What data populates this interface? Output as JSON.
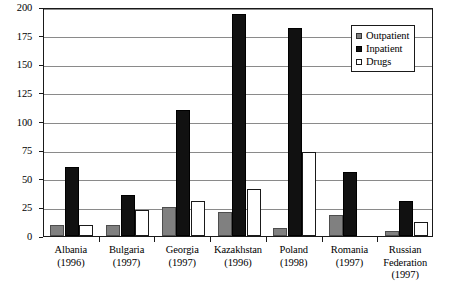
{
  "chart_data": {
    "type": "bar",
    "title": "",
    "subtitle": "",
    "xlabel": "",
    "ylabel": "",
    "ylim": [
      0,
      200
    ],
    "yticks": [
      0,
      25,
      50,
      75,
      100,
      125,
      150,
      175,
      200
    ],
    "ytick_labels": [
      "0",
      "25",
      "50",
      "75",
      "100",
      "125",
      "150",
      "175",
      "200"
    ],
    "grid": true,
    "legend_position": "top-right",
    "categories": [
      "Albania",
      "Bulgaria",
      "Georgia",
      "Kazakhstan",
      "Poland",
      "Romania",
      "Russian Federation"
    ],
    "category_years": [
      "(1996)",
      "(1997)",
      "(1997)",
      "(1996)",
      "(1998)",
      "(1997)",
      "(1997)"
    ],
    "series": [
      {
        "name": "Outpatient",
        "color": "#808080",
        "values": [
          10,
          10,
          25,
          21,
          7,
          18,
          4
        ]
      },
      {
        "name": "Inpatient",
        "color": "#111111",
        "values": [
          60,
          36,
          110,
          194,
          182,
          56,
          31
        ]
      },
      {
        "name": "Drugs",
        "color": "#ffffff",
        "values": [
          10,
          23,
          31,
          41,
          73,
          0,
          12
        ]
      }
    ]
  },
  "legend": {
    "items": [
      {
        "label": "Outpatient",
        "swatch": "outpatient"
      },
      {
        "label": "Inpatient",
        "swatch": "inpatient"
      },
      {
        "label": "Drugs",
        "swatch": "drugs"
      }
    ]
  },
  "colors": {
    "outpatient": "#808080",
    "inpatient": "#111111",
    "drugs": "#ffffff",
    "axis": "#1a1a1a",
    "gridline": "#8a8a8a",
    "background": "#ffffff"
  }
}
